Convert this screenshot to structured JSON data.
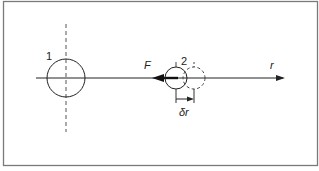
{
  "diagram": {
    "labels": {
      "particle1": "1",
      "particle2": "2",
      "force": "F",
      "axis": "r",
      "displacement": "δr"
    },
    "elements": {
      "frame": {
        "x": 3,
        "y": 1,
        "width": 315,
        "height": 165,
        "stroke": "#6e6e6e"
      },
      "axis_line": {
        "x1": 36,
        "x2": 284,
        "y": 78,
        "arrow": "right"
      },
      "particle1": {
        "cx": 66,
        "cy": 78,
        "r": 19,
        "style": "solid",
        "centerline": "vertical-dashed"
      },
      "particle2_initial": {
        "cx": 176,
        "cy": 78,
        "r": 11,
        "style": "solid"
      },
      "particle2_displaced": {
        "cx": 194,
        "cy": 78,
        "r": 11,
        "style": "dashed"
      },
      "force_arrow": {
        "from_x": 178,
        "to_x": 153,
        "y": 78,
        "direction": "left",
        "weight": "bold"
      },
      "displacement_dimension": {
        "x1": 176,
        "x2": 194,
        "y": 99,
        "direction": "right"
      }
    },
    "colors": {
      "line": "#222222",
      "dashed": "#555555",
      "frame": "#6e6e6e",
      "background": "#ffffff"
    }
  }
}
